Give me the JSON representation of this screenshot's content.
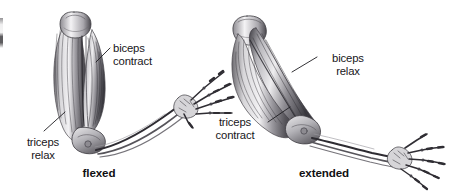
{
  "figure": {
    "background_color": "#ffffff",
    "ink_color": "#17161a",
    "style": "pen-and-ink anatomical illustration, grayscale"
  },
  "labels": {
    "biceps_contract": "biceps\ncontract",
    "triceps_relax": "triceps\nrelax",
    "biceps_relax": "biceps\nrelax",
    "triceps_contract": "triceps\ncontract"
  },
  "captions": {
    "flexed": "flexed",
    "extended": "extended"
  },
  "panels": [
    {
      "name": "flexed-arm",
      "caption": "flexed",
      "labels": [
        "biceps contract",
        "triceps relax"
      ]
    },
    {
      "name": "extended-arm",
      "caption": "extended",
      "labels": [
        "biceps relax",
        "triceps contract"
      ]
    }
  ]
}
